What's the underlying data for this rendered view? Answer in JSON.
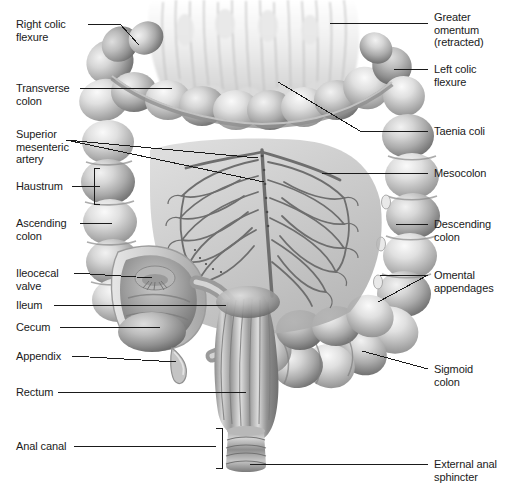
{
  "figure": {
    "style": "grayscale medical illustration",
    "background_color": "#ffffff",
    "leader_line_color": "#1a1a1a",
    "label_text_color": "#1a1a1a",
    "caption": ""
  },
  "labels": {
    "right_colic_flexure": "Right colic\nflexure",
    "transverse_colon": "Transverse\ncolon",
    "superior_mesenteric_artery": "Superior\nmesenteric\nartery",
    "haustrum": "Haustrum",
    "ascending_colon": "Ascending\ncolon",
    "ileocecal_valve": "Ileocecal\nvalve",
    "ileum": "Ileum",
    "cecum": "Cecum",
    "appendix": "Appendix",
    "rectum": "Rectum",
    "anal_canal": "Anal canal",
    "greater_omentum": "Greater\nomentum\n(retracted)",
    "left_colic_flexure": "Left colic\nflexure",
    "taenia_coli": "Taenia coli",
    "mesocolon": "Mesocolon",
    "descending_colon": "Descending\ncolon",
    "omental_appendages": "Omental\nappendages",
    "sigmoid_colon": "Sigmoid\ncolon",
    "external_anal_sphincter": "External anal\nsphincter"
  }
}
